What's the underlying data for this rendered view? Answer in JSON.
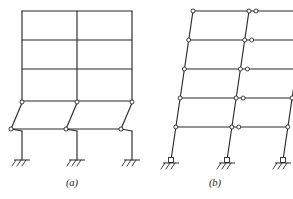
{
  "figure": {
    "background_color": "#ffffff",
    "line_color": "#2b2b2b",
    "joint_fill_color": "#ffffff",
    "width": 293,
    "height": 199,
    "panels": [
      {
        "id": "a",
        "caption": "(a)",
        "caption_x": 72,
        "caption_y": 186,
        "description": "Two-bay multistory frame: upper three stories rigid and undeformed, lower two stories pin-connected and swayed into parallelograms, fixed bases",
        "bays": 2,
        "stories": 5,
        "rigid_stories": 3,
        "pinned_stories": 2,
        "support_type": "fixed",
        "support_count": 3,
        "pin_joint_count": 6,
        "columns_x": [
          22,
          77,
          132
        ],
        "rigid_beam_levels_y": [
          11,
          40,
          69,
          101
        ],
        "sway_offset_px": 12,
        "base_y": 160,
        "deformed": true
      },
      {
        "id": "b",
        "caption": "(b)",
        "caption_x": 215,
        "caption_y": 186,
        "description": "Two-bay five-story frame with pin connections at every beam-column joint, fully swayed to the right, pinned bases",
        "bays": 2,
        "stories": 5,
        "rigid_stories": 0,
        "pinned_stories": 5,
        "support_type": "pinned",
        "support_count": 3,
        "pin_joint_count": 18,
        "columns_x": [
          175,
          232,
          289
        ],
        "beam_levels_y": [
          11,
          40,
          69,
          98,
          127
        ],
        "sway_offset_px": 22,
        "base_y": 160,
        "deformed": true
      }
    ]
  }
}
